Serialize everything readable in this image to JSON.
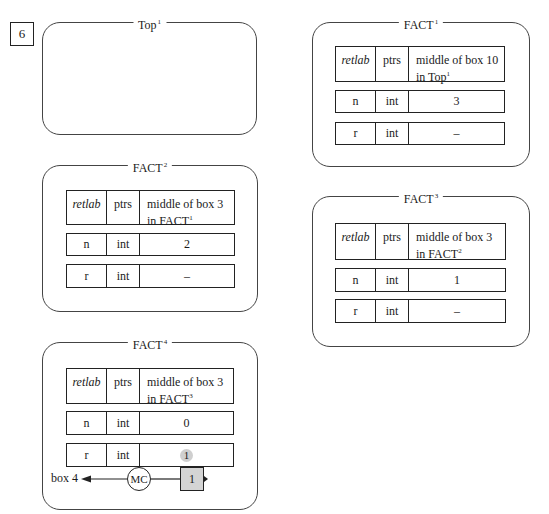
{
  "step_number": "6",
  "frames": {
    "top1": {
      "name": "Top",
      "sup": "1"
    },
    "fact1": {
      "name": "FACT",
      "sup": "1",
      "header": {
        "col1": "retlab",
        "col2": "ptrs",
        "col3_line1": "middle of box 10",
        "col3_line2": "in Top",
        "col3_sup": "1"
      },
      "rows": [
        {
          "name": "n",
          "type": "int",
          "value": "3"
        },
        {
          "name": "r",
          "type": "int",
          "value": "–"
        }
      ]
    },
    "fact2": {
      "name": "FACT",
      "sup": "2",
      "header": {
        "col1": "retlab",
        "col2": "ptrs",
        "col3_line1": "middle of box 3",
        "col3_line2": "in FACT",
        "col3_sup": "1"
      },
      "rows": [
        {
          "name": "n",
          "type": "int",
          "value": "2"
        },
        {
          "name": "r",
          "type": "int",
          "value": "–"
        }
      ]
    },
    "fact3": {
      "name": "FACT",
      "sup": "3",
      "header": {
        "col1": "retlab",
        "col2": "ptrs",
        "col3_line1": "middle of box 3",
        "col3_line2": "in FACT",
        "col3_sup": "2"
      },
      "rows": [
        {
          "name": "n",
          "type": "int",
          "value": "1"
        },
        {
          "name": "r",
          "type": "int",
          "value": "–"
        }
      ]
    },
    "fact4": {
      "name": "FACT",
      "sup": "4",
      "header": {
        "col1": "retlab",
        "col2": "ptrs",
        "col3_line1": "middle of box 3",
        "col3_line2": "in FACT",
        "col3_sup": "3"
      },
      "rows": [
        {
          "name": "n",
          "type": "int",
          "value": "0"
        },
        {
          "name": "r",
          "type": "int",
          "value": "1"
        }
      ],
      "return_flow": {
        "target_label": "box 4",
        "mc_label": "MC",
        "value": "1"
      }
    }
  },
  "colors": {
    "stroke": "#222222",
    "shade": "#d4d4d4",
    "highlight": "#cfcfcf"
  }
}
